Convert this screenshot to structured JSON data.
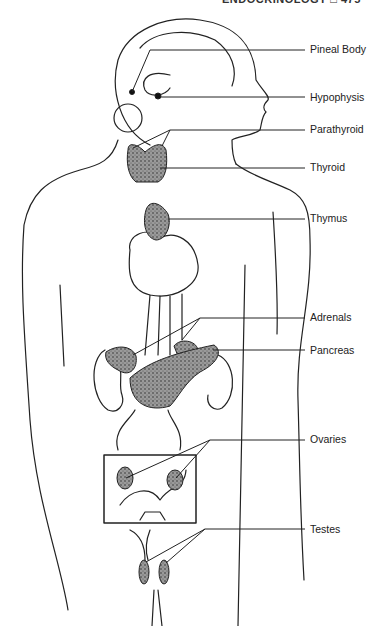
{
  "header": {
    "running_title": "ENDOCRINOLOGY □ 475"
  },
  "diagram": {
    "labels": [
      {
        "text": "Pineal Body",
        "y": 43
      },
      {
        "text": "Hypophysis",
        "y": 91
      },
      {
        "text": "Parathyroid",
        "y": 123
      },
      {
        "text": "Thyroid",
        "y": 161
      },
      {
        "text": "Thymus",
        "y": 212
      },
      {
        "text": "Adrenals",
        "y": 311
      },
      {
        "text": "Pancreas",
        "y": 344
      },
      {
        "text": "Ovaries",
        "y": 433
      },
      {
        "text": "Testes",
        "y": 523
      }
    ]
  }
}
